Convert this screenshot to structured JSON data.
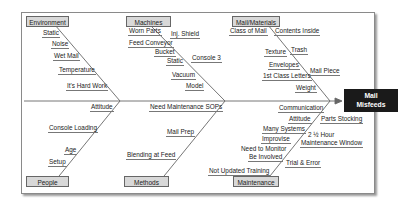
{
  "diagram": {
    "type": "fishbone",
    "effect": {
      "line1": "Mail",
      "line2": "Misfeeds"
    },
    "categories": {
      "environment": {
        "label": "Environment",
        "causes": [
          "Static",
          "Noise",
          "Wet Mail",
          "Temperature",
          "It's Hard Work"
        ]
      },
      "machines": {
        "label": "Machines",
        "causes": [
          "Worn Parts",
          "Inj. Shield",
          "Feed Conveyor",
          "Bucket",
          "Console 3",
          "Static",
          "Vacuum",
          "Model"
        ]
      },
      "mail_materials": {
        "label": "Mail/Materials",
        "causes": [
          "Class of Mail",
          "Contents Inside",
          "Texture",
          "Trash",
          "Envelopes",
          "1st Class Letters",
          "Mail Piece",
          "Weight"
        ]
      },
      "people": {
        "label": "People",
        "causes": [
          "Attitude",
          "Console Loading",
          "Age",
          "Setup"
        ]
      },
      "methods": {
        "label": "Methods",
        "causes": [
          "Need Maintenance SOPs",
          "Mail Prep",
          "Blending at Feed"
        ]
      },
      "maintenance": {
        "label": "Maintenance",
        "causes": [
          "Communication",
          "Attitude",
          "Parts Stocking",
          "Many Systems",
          "2 ½ Hour",
          "Maintenance Window",
          "Improvise",
          "Need to Monitor",
          "Be Involved",
          "Trial & Error",
          "Not Updated Training"
        ]
      }
    }
  }
}
